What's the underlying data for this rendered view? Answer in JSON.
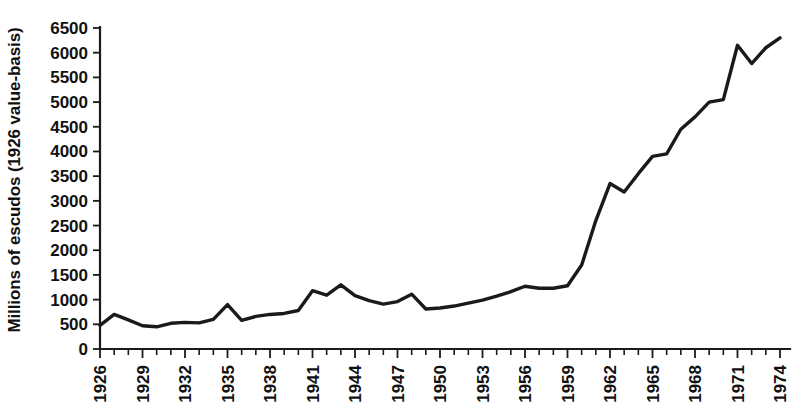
{
  "chart_data": {
    "type": "line",
    "title": "",
    "subtitle": "",
    "xlabel": "",
    "ylabel": "Millions of escudos (1926 value-basis)",
    "xlim": [
      1926,
      1974
    ],
    "ylim": [
      0,
      6500
    ],
    "grid": false,
    "legend": null,
    "y_ticks": [
      0,
      500,
      1000,
      1500,
      2000,
      2500,
      3000,
      3500,
      4000,
      4500,
      5000,
      5500,
      6000,
      6500
    ],
    "y_tick_labels": [
      "0",
      "500",
      "1000",
      "1500",
      "2000",
      "2500",
      "3000",
      "3500",
      "4000",
      "4500",
      "5000",
      "5500",
      "6000",
      "6500"
    ],
    "x_tick_labels": [
      "1926",
      "1929",
      "1932",
      "1935",
      "1938",
      "1941",
      "1944",
      "1947",
      "1950",
      "1953",
      "1956",
      "1959",
      "1962",
      "1965",
      "1968",
      "1971",
      "1974"
    ],
    "x_tick_label_step": 3,
    "x_minor_ticks_every": 1,
    "series": [
      {
        "name": "Portuguese industrial output",
        "color": "#1a1a1a",
        "x": [
          1926,
          1927,
          1928,
          1929,
          1930,
          1931,
          1932,
          1933,
          1934,
          1935,
          1936,
          1937,
          1938,
          1939,
          1940,
          1941,
          1942,
          1943,
          1944,
          1945,
          1946,
          1947,
          1948,
          1949,
          1950,
          1951,
          1952,
          1953,
          1954,
          1955,
          1956,
          1957,
          1958,
          1959,
          1960,
          1961,
          1962,
          1963,
          1964,
          1965,
          1966,
          1967,
          1968,
          1969,
          1970,
          1971,
          1972,
          1973,
          1974
        ],
        "values": [
          480,
          700,
          590,
          470,
          450,
          520,
          540,
          530,
          600,
          900,
          580,
          660,
          700,
          720,
          780,
          1180,
          1090,
          1300,
          1080,
          980,
          910,
          960,
          1110,
          810,
          830,
          870,
          930,
          990,
          1070,
          1160,
          1270,
          1230,
          1230,
          1280,
          1700,
          2600,
          3350,
          3180,
          3550,
          3900,
          3950,
          4450,
          4700,
          5000,
          5050,
          6150,
          5780,
          6100,
          6300
        ]
      }
    ]
  },
  "axes": {
    "y_axis_name": "vertical-value-axis",
    "x_axis_name": "horizontal-year-axis"
  }
}
